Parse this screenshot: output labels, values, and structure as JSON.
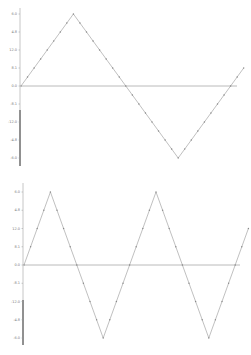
{
  "chart_data": [
    {
      "type": "line",
      "title": "",
      "xlabel": "",
      "ylabel": "",
      "grid": false,
      "legend": null,
      "description": "Triangle wave, one full period, with point markers",
      "y_tick_labels": [
        "6.0",
        "4.8",
        "12.0",
        "8.1",
        "0.0",
        "-8.1",
        "-12.0",
        "-4.8",
        "-6.0"
      ],
      "ylim": [
        -1,
        1
      ],
      "series": [
        {
          "name": "triangle-wave-1",
          "color": "#b0b0b0",
          "x": [
            0,
            1,
            2,
            3,
            4,
            5,
            6,
            7,
            8,
            9,
            10,
            11,
            12,
            13,
            14,
            15,
            16,
            17,
            18,
            19,
            20,
            21,
            22,
            23,
            24,
            25,
            26,
            27,
            28,
            29,
            30,
            31,
            32,
            33,
            34
          ],
          "values": [
            0,
            0.125,
            0.25,
            0.375,
            0.5,
            0.625,
            0.75,
            0.875,
            1,
            0.875,
            0.75,
            0.625,
            0.5,
            0.375,
            0.25,
            0.125,
            0,
            -0.125,
            -0.25,
            -0.375,
            -0.5,
            -0.625,
            -0.75,
            -0.875,
            -1,
            -0.875,
            -0.75,
            -0.625,
            -0.5,
            -0.375,
            -0.25,
            -0.125,
            0,
            0.125,
            0.25
          ]
        }
      ],
      "baseline": 0
    },
    {
      "type": "line",
      "title": "",
      "xlabel": "",
      "ylabel": "",
      "grid": false,
      "legend": null,
      "description": "Triangle wave, two full periods, with point markers",
      "y_tick_labels": [
        "6.0",
        "4.8",
        "12.0",
        "8.1",
        "0.0",
        "-8.1",
        "-12.0",
        "-4.8",
        "-6.0"
      ],
      "ylim": [
        -1,
        1
      ],
      "series": [
        {
          "name": "triangle-wave-2",
          "color": "#b0b0b0",
          "x": [
            0,
            1,
            2,
            3,
            4,
            5,
            6,
            7,
            8,
            9,
            10,
            11,
            12,
            13,
            14,
            15,
            16,
            17,
            18,
            19,
            20,
            21,
            22,
            23,
            24,
            25,
            26,
            27,
            28,
            29,
            30,
            31,
            32,
            33,
            34
          ],
          "values": [
            0,
            0.25,
            0.5,
            0.75,
            1,
            0.75,
            0.5,
            0.25,
            0,
            -0.25,
            -0.5,
            -0.75,
            -1,
            -0.75,
            -0.5,
            -0.25,
            0,
            0.25,
            0.5,
            0.75,
            1,
            0.75,
            0.5,
            0.25,
            0,
            -0.25,
            -0.5,
            -0.75,
            -1,
            -0.75,
            -0.5,
            -0.25,
            0,
            0.25,
            0.5
          ]
        }
      ],
      "baseline": 0
    }
  ],
  "style": {
    "line_color": "#b0b0b0",
    "marker_color": "#888888",
    "baseline_color": "#a8a8a8",
    "axis_color_top": "#b8b8b8",
    "axis_color_bottom": "#222222",
    "label_color": "#777777"
  }
}
